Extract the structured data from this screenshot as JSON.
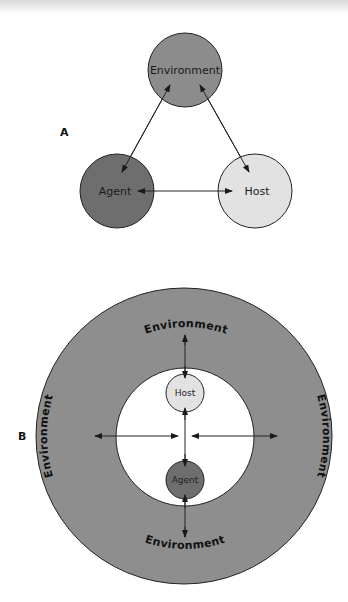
{
  "colors": {
    "environment": "#8c8c8c",
    "agent": "#6e6e6e",
    "host": "#e2e2e2",
    "outer_ring": "#8e8e8e",
    "inner_space": "#ffffff",
    "stroke": "#222222"
  },
  "panel_a": {
    "label": "A",
    "nodes": {
      "environment": "Environment",
      "agent": "Agent",
      "host": "Host"
    },
    "edges": [
      {
        "from": "Environment",
        "to": "Agent",
        "type": "bidirectional"
      },
      {
        "from": "Environment",
        "to": "Host",
        "type": "bidirectional"
      },
      {
        "from": "Agent",
        "to": "Host",
        "type": "bidirectional"
      }
    ]
  },
  "panel_b": {
    "label": "B",
    "environment_top": "Environment",
    "environment_bottom": "Environment",
    "environment_left": "Environment",
    "environment_right": "Environment",
    "host": "Host",
    "agent": "Agent"
  }
}
